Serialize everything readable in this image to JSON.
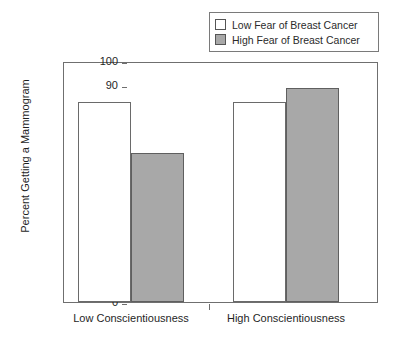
{
  "chart_data": {
    "type": "bar",
    "title": "",
    "xlabel": "",
    "ylabel": "Percent Getting a Mammogram",
    "categories": [
      "Low Conscientiousness",
      "High Conscientiousness"
    ],
    "series": [
      {
        "name": "Low Fear of Breast Cancer",
        "values": [
          83,
          83
        ],
        "color": "#ffffff",
        "swatch": "white"
      },
      {
        "name": "High Fear of Breast Cancer",
        "values": [
          62,
          89
        ],
        "color": "#a8a8a8",
        "swatch": "gray"
      }
    ],
    "ylim": [
      0,
      100
    ],
    "yticks": [
      0,
      10,
      20,
      30,
      40,
      50,
      60,
      70,
      80,
      90,
      100
    ],
    "ytick_labels": [
      "0",
      "10",
      "20",
      "30",
      "40",
      "50",
      "60",
      "70",
      "80",
      "90",
      "100"
    ],
    "grid": false,
    "legend_position": "top-right"
  },
  "legend": {
    "items": [
      {
        "label": "Low Fear of Breast Cancer",
        "swatch": "white"
      },
      {
        "label": "High Fear of Breast Cancer",
        "swatch": "gray"
      }
    ]
  },
  "axes": {
    "y_title": "Percent Getting a Mammogram",
    "x_categories": [
      {
        "label": "Low Conscientiousness"
      },
      {
        "label": "High Conscientiousness"
      }
    ]
  }
}
